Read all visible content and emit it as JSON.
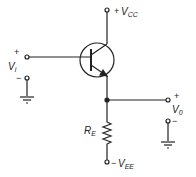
{
  "diagram": {
    "type": "emitter-follower circuit",
    "labels": {
      "vcc": "V",
      "vcc_sub": "CC",
      "vcc_sign": "+",
      "vee": "V",
      "vee_sub": "EE",
      "vee_sign": "−",
      "vi": "V",
      "vi_sub": "i",
      "vi_plus": "+",
      "vi_minus": "−",
      "vo": "V",
      "vo_sub": "0",
      "vo_plus": "+",
      "vo_minus": "−",
      "re": "R",
      "re_sub": "E"
    },
    "components": [
      {
        "name": "Q1",
        "kind": "NPN transistor"
      },
      {
        "name": "RE",
        "kind": "resistor"
      }
    ]
  }
}
